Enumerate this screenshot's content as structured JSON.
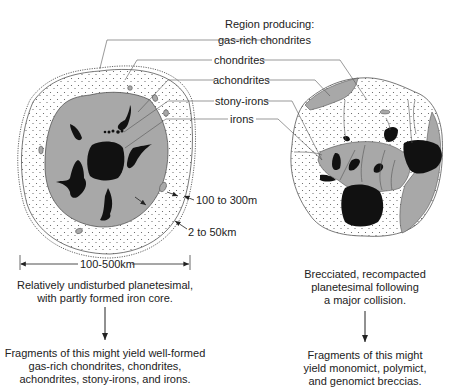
{
  "legend": {
    "header": "Region producing:",
    "items": [
      {
        "key": "gas_rich",
        "label": "gas-rich chondrites"
      },
      {
        "key": "chondrites",
        "label": "chondrites"
      },
      {
        "key": "achondrites",
        "label": "achondrites"
      },
      {
        "key": "stony_irons",
        "label": "stony-irons"
      },
      {
        "key": "irons",
        "label": "irons"
      }
    ]
  },
  "left_body": {
    "dim_inclusion": "100 to 300m",
    "dim_crust": "2 to 50km",
    "dim_diameter": "100-500km",
    "caption_line1": "Relatively undisturbed planetesimal,",
    "caption_line2": "with partly formed iron core.",
    "result_line1": "Fragments of this might yield well-formed",
    "result_line2": "gas-rich chondrites, chondrites,",
    "result_line3": "achondrites, stony-irons, and irons."
  },
  "right_body": {
    "caption_line1": "Brecciated, recompacted",
    "caption_line2": "planetesimal following",
    "caption_line3": "a major collision.",
    "result_line1": "Fragments of this might",
    "result_line2": "yield monomict, polymict,",
    "result_line3": "and genomict breccias."
  },
  "colors": {
    "gray_region": "#a8a8a8",
    "iron_black": "#111111",
    "stipple_bg": "#ffffff",
    "line": "#444444"
  }
}
